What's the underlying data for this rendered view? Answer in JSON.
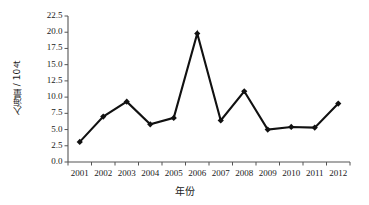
{
  "chart_data": {
    "type": "line",
    "title": "",
    "xlabel": "年份",
    "ylabel": "入海量 / 10⁴ t",
    "ylabel_main": "入海量 / 10",
    "ylabel_exp": "4",
    "ylabel_unit": " t",
    "categories": [
      "2001",
      "2002",
      "2003",
      "2004",
      "2005",
      "2006",
      "2007",
      "2008",
      "2009",
      "2010",
      "2011",
      "2012"
    ],
    "values": [
      3.1,
      7.0,
      9.3,
      5.8,
      6.8,
      19.8,
      6.4,
      10.9,
      5.0,
      5.4,
      5.3,
      9.0
    ],
    "series": [
      {
        "name": "入海量",
        "values": [
          3.1,
          7.0,
          9.3,
          5.8,
          6.8,
          19.8,
          6.4,
          10.9,
          5.0,
          5.4,
          5.3,
          9.0
        ]
      }
    ],
    "ylim": [
      0.0,
      22.5
    ],
    "y_ticks": [
      "0.0",
      "2.5",
      "5.0",
      "7.5",
      "10.0",
      "12.5",
      "15.0",
      "17.5",
      "20.0",
      "22.5"
    ],
    "y_tick_values": [
      0.0,
      2.5,
      5.0,
      7.5,
      10.0,
      12.5,
      15.0,
      17.5,
      20.0,
      22.5
    ],
    "x_ticks": [
      "2001",
      "2002",
      "2003",
      "2004",
      "2005",
      "2006",
      "2007",
      "2008",
      "2009",
      "2010",
      "2011",
      "2012"
    ],
    "grid": false,
    "legend": false,
    "legend_position": "none",
    "marker": "diamond",
    "line_color": "#111111",
    "marker_color": "#111111",
    "axis_color": "#555555",
    "background_color": "#ffffff"
  }
}
